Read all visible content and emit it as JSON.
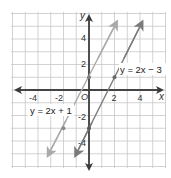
{
  "chart_data": {
    "type": "line",
    "title": "",
    "xlabel": "x",
    "ylabel": "y",
    "xlim": [
      -6,
      6
    ],
    "ylim": [
      -6,
      6
    ],
    "grid": true,
    "origin_label": "O",
    "x_ticks": [
      -4,
      -2,
      2,
      4
    ],
    "y_ticks": [
      4,
      2,
      -2,
      -4
    ],
    "x_tick_labels": [
      "-4",
      "-2",
      "2",
      "4"
    ],
    "y_tick_labels": [
      "4",
      "2",
      "-2",
      "-4"
    ],
    "series": [
      {
        "name": "y = 2x + 1",
        "equation": "y = 2x + 1",
        "slope": 2,
        "intercept": 1,
        "color": "#a9a9a9",
        "x_range": [
          -3,
          2.1
        ],
        "points": [
          {
            "x": 0,
            "y": 1
          },
          {
            "x": -2,
            "y": -3
          }
        ]
      },
      {
        "name": "y = 2x - 3",
        "equation": "y = 2x − 3",
        "slope": 2,
        "intercept": -3,
        "color": "#7a7a7a",
        "x_range": [
          -1,
          4.1
        ],
        "points": [
          {
            "x": 2,
            "y": 1
          },
          {
            "x": 0,
            "y": -3
          }
        ]
      }
    ],
    "annotations": [
      {
        "text": "y = 2x − 3",
        "near": [
          2.3,
          1.8
        ]
      },
      {
        "text": "y = 2x + 1",
        "near": [
          -4.2,
          -1.5
        ]
      }
    ],
    "colors": {
      "grid": "#c8c8c8",
      "axis": "#3a3a3a"
    }
  }
}
